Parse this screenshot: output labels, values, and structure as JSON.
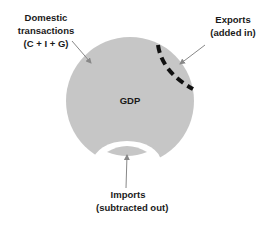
{
  "diagram": {
    "center_label": "GDP",
    "labels": {
      "domestic": {
        "lines": [
          "Domestic",
          "transactions",
          "(C + I + G)"
        ]
      },
      "exports": {
        "lines": [
          "Exports",
          "(added in)"
        ]
      },
      "imports": {
        "lines": [
          "Imports",
          "(subtracted out)"
        ]
      }
    },
    "colors": {
      "circle_fill": "#c6c6c6",
      "dashed_arc": "#111111",
      "arrow": "#888888",
      "text": "#1a1a1a",
      "background": "#ffffff"
    }
  }
}
